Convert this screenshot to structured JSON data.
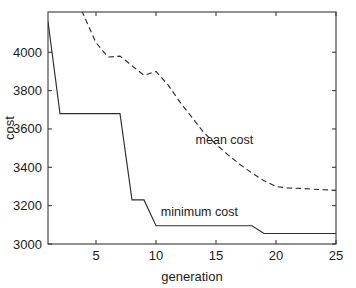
{
  "chart_data": {
    "type": "line",
    "title": "",
    "xlabel": "generation",
    "ylabel": "cost",
    "xlim": [
      1,
      25
    ],
    "ylim": [
      3000,
      4210
    ],
    "grid": false,
    "legend_position": "inline-annotations",
    "xticks": [
      5,
      10,
      15,
      20,
      25
    ],
    "xtick_labels": [
      "5",
      "10",
      "15",
      "20",
      "25"
    ],
    "yticks": [
      3000,
      3200,
      3400,
      3600,
      3800,
      4000
    ],
    "ytick_labels": [
      "3000",
      "3200",
      "3400",
      "3600",
      "3800",
      "4000"
    ],
    "x": [
      1,
      2,
      3,
      4,
      5,
      6,
      7,
      8,
      9,
      10,
      11,
      12,
      13,
      14,
      15,
      16,
      17,
      18,
      19,
      20,
      21,
      22,
      23,
      24,
      25
    ],
    "series": [
      {
        "name": "mean cost",
        "style": "dashed",
        "color": "#2e2e2e",
        "clipped_above_axis": true,
        "values": [
          4600,
          4480,
          4330,
          4190,
          4050,
          3975,
          3980,
          3930,
          3880,
          3900,
          3830,
          3740,
          3660,
          3580,
          3520,
          3465,
          3415,
          3370,
          3330,
          3300,
          3292,
          3290,
          3286,
          3283,
          3280
        ]
      },
      {
        "name": "minimum cost",
        "style": "solid",
        "color": "#2e2e2e",
        "clipped_above_axis": false,
        "values": [
          4160,
          3680,
          3680,
          3680,
          3680,
          3680,
          3680,
          3230,
          3230,
          3095,
          3095,
          3095,
          3095,
          3095,
          3095,
          3095,
          3095,
          3095,
          3055,
          3055,
          3055,
          3055,
          3055,
          3055,
          3055
        ]
      }
    ],
    "annotations": [
      {
        "text": "mean cost",
        "x": 13.3,
        "y": 3520,
        "series": "mean cost"
      },
      {
        "text": "minimum cost",
        "x": 10.4,
        "y": 3145,
        "series": "minimum cost"
      }
    ]
  }
}
